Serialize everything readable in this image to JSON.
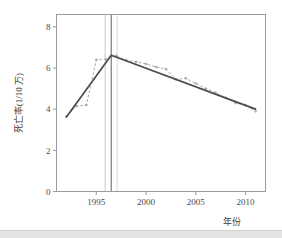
{
  "chart_data": {
    "type": "line",
    "title": "",
    "subtitle": "",
    "xlabel": "年份",
    "ylabel": "死亡率(1/10 万)",
    "xlim": [
      1991.0,
      2012.0
    ],
    "ylim": [
      0,
      8.6
    ],
    "xticks": [
      1995,
      2000,
      2005,
      2010
    ],
    "xtick_labels": [
      "1995",
      "2000",
      "2005",
      "2010"
    ],
    "yticks": [
      0,
      2,
      4,
      6,
      8
    ],
    "ytick_labels": [
      "0",
      "2",
      "4",
      "6",
      "8"
    ],
    "grid": false,
    "legend": "none",
    "series": [
      {
        "name": "observed",
        "style": "dashed-with-markers",
        "color": "#8f8f97",
        "x": [
          1992,
          1993,
          1994,
          1995,
          1996,
          1997,
          1998,
          1999,
          2000,
          2001,
          2002,
          2003,
          2004,
          2005,
          2006,
          2007,
          2008,
          2009,
          2010,
          2011
        ],
        "values": [
          3.65,
          4.15,
          4.2,
          6.4,
          6.42,
          6.6,
          6.38,
          6.3,
          6.2,
          6.05,
          5.95,
          5.45,
          5.5,
          5.25,
          5.0,
          4.8,
          4.55,
          4.3,
          4.2,
          3.9
        ]
      },
      {
        "name": "joinpoint-fit",
        "style": "solid",
        "color": "#4a4a52",
        "x": [
          1992,
          1996.5,
          2011
        ],
        "values": [
          3.62,
          6.62,
          4.0
        ]
      }
    ],
    "joinpoints": [
      {
        "x": 1996.5,
        "color": "#6e6e76",
        "style": "solid-vertical"
      },
      {
        "x": 1995.9,
        "color": "#d8d8dc",
        "style": "solid-vertical"
      },
      {
        "x": 1997.1,
        "color": "#e4e4e8",
        "style": "solid-vertical"
      }
    ],
    "annotations": []
  },
  "colors": {
    "frame": "#9a9aa0",
    "observed": "#8f8f97",
    "fit": "#4a4a52",
    "joinpoint": "#6e6e76",
    "joinpoint_ci": "#d9d9dd",
    "text": "#3d3d3d",
    "bottom_band": "#e3e3e3"
  }
}
